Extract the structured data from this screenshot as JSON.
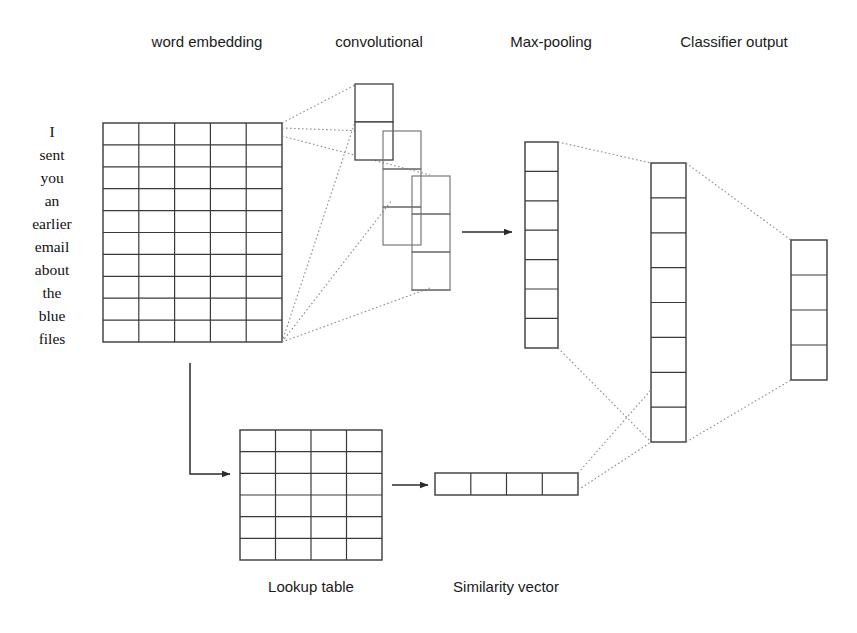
{
  "figure": {
    "background_color": "#ffffff",
    "line_color": "#3a3a3a",
    "dotted_line_color": "#8c8c8c",
    "arrow_color": "#2b2b2b"
  },
  "stage_labels": {
    "word_embedding": "word embedding",
    "convolutional": "convolutional",
    "max_pooling": "Max-pooling",
    "classifier_output": "Classifier output",
    "lookup_table": "Lookup table",
    "similarity_vector": "Similarity vector"
  },
  "input_sentence": {
    "words": [
      "I",
      "sent",
      "you",
      "an",
      "earlier",
      "email",
      "about",
      "the",
      "blue",
      "files"
    ],
    "word_count": 10
  },
  "layers": {
    "word_embedding_grid": {
      "name": "word embedding matrix",
      "columns": 5,
      "rows": 10
    },
    "convolutional_columns": [
      {
        "name": "conv-feature-map-1",
        "cells": 2
      },
      {
        "name": "conv-feature-map-2",
        "cells": 3
      },
      {
        "name": "conv-feature-map-3",
        "cells": 4
      }
    ],
    "max_pooling_column": {
      "name": "max-pooling vector",
      "cells": 7
    },
    "classifier_hidden_column": {
      "name": "classifier hidden layer",
      "cells": 8
    },
    "classifier_output_column": {
      "name": "classifier output layer",
      "cells": 4
    },
    "lookup_table_grid": {
      "name": "lookup table matrix",
      "columns": 4,
      "rows": 6
    },
    "similarity_vector_row": {
      "name": "similarity vector",
      "cells": 4,
      "orientation": "horizontal"
    }
  },
  "connections": [
    {
      "from": "word-embedding-grid",
      "to": "convolutional-layer",
      "style": "dotted"
    },
    {
      "from": "convolutional-layer",
      "to": "max-pooling",
      "style": "solid-arrow"
    },
    {
      "from": "max-pooling",
      "to": "classifier-hidden",
      "style": "dotted"
    },
    {
      "from": "classifier-hidden",
      "to": "classifier-output",
      "style": "dotted"
    },
    {
      "from": "word-embedding-grid",
      "to": "lookup-table",
      "style": "solid-arrow"
    },
    {
      "from": "lookup-table",
      "to": "similarity-vector",
      "style": "solid-arrow"
    },
    {
      "from": "similarity-vector",
      "to": "classifier-hidden",
      "style": "dotted"
    }
  ]
}
